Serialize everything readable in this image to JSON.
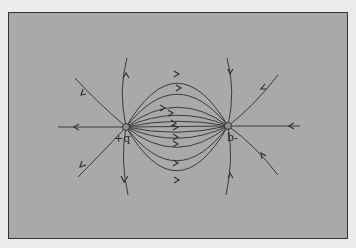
{
  "diagram": {
    "title": "",
    "type": "electric field lines of a dipole",
    "background_color": "#a9a9a9",
    "line_color": "#333333",
    "charges": [
      {
        "label": "+q",
        "x": 126,
        "y": 127,
        "sign": "positive"
      },
      {
        "label": "-q",
        "x": 228,
        "y": 126,
        "sign": "negative",
        "label_rotated": true
      }
    ]
  }
}
